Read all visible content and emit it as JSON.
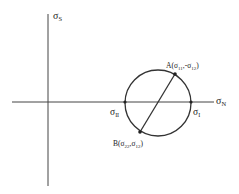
{
  "diagram": {
    "axes": {
      "vertical_label": "σ",
      "vertical_sub": "S",
      "horizontal_label": "σ",
      "horizontal_sub": "N"
    },
    "points": {
      "A": {
        "label": "A(σ",
        "sub1": "11",
        "mid": ",-σ",
        "sub2": "12",
        "end": ")"
      },
      "B": {
        "label": "B(σ",
        "sub1": "22",
        "mid": ",σ",
        "sub2": "12",
        "end": ")"
      },
      "sigma_I": {
        "label": "σ",
        "sub": "I"
      },
      "sigma_II": {
        "label": "σ",
        "sub": "II"
      }
    },
    "colors": {
      "line": "#333333",
      "text": "#222222"
    }
  }
}
